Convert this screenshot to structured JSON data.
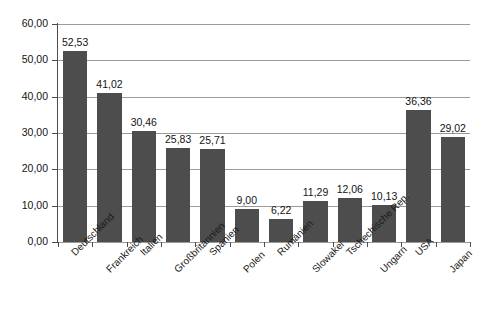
{
  "chart_data": {
    "type": "bar",
    "title": "",
    "subtitle": "",
    "xlabel": "",
    "ylabel": "",
    "ylim": [
      0,
      60
    ],
    "ytick_step": 10,
    "grid": true,
    "legend": "none",
    "decimal_separator": ",",
    "bar_color": "#4d4d4d",
    "gridline_color": "#9a9a9a",
    "axis_color": "#4d4d4d",
    "background_color": "#ffffff",
    "ytick_labels": [
      "0,00",
      "10,00",
      "20,00",
      "30,00",
      "40,00",
      "50,00",
      "60,00"
    ],
    "ytick_values": [
      0,
      10,
      20,
      30,
      40,
      50,
      60
    ],
    "categories": [
      "Deutschland",
      "Frankreich",
      "Italien",
      "Großbritannien",
      "Spanien",
      "Polen",
      "Rumänien",
      "Slowakei",
      "Tschechische Rep.",
      "Ungarn",
      "USA",
      "Japan"
    ],
    "values": [
      52.53,
      41.02,
      30.46,
      25.83,
      25.71,
      9.0,
      6.22,
      11.29,
      12.06,
      10.13,
      36.36,
      29.02
    ],
    "value_labels": [
      "52,53",
      "41,02",
      "30,46",
      "25,83",
      "25,71",
      "9,00",
      "6,22",
      "11,29",
      "12,06",
      "10,13",
      "36,36",
      "29,02"
    ]
  }
}
